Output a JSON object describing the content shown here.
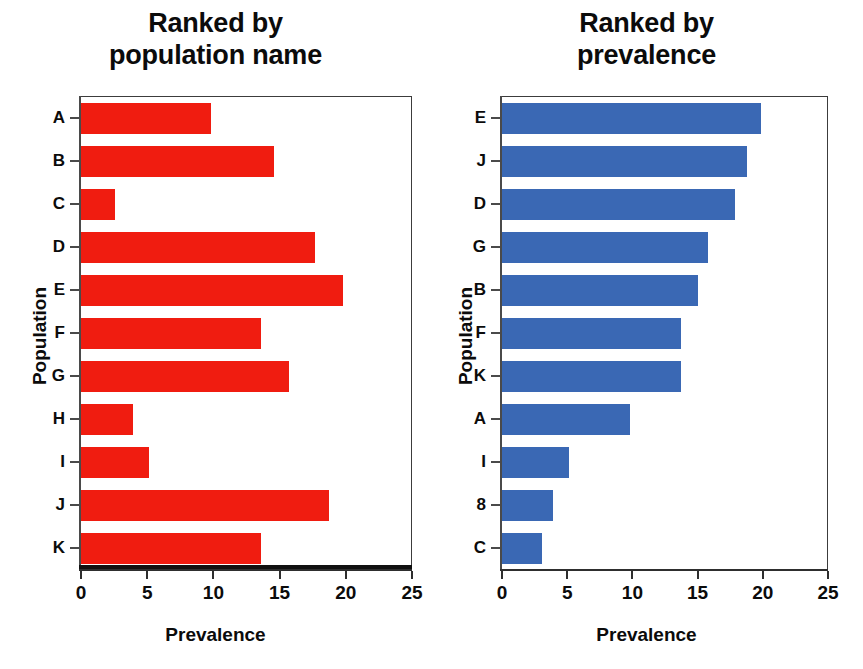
{
  "figure": {
    "axis_color": "#2e2e2e",
    "text_color": "#0b0b0b",
    "background": "#ffffff"
  },
  "panels": [
    {
      "id": "left",
      "title_line1": "Ranked by",
      "title_line2": "population name",
      "xlabel": "Prevalence",
      "ylabel": "Population"
    },
    {
      "id": "right",
      "title_line1": "Ranked by",
      "title_line2": "prevalence",
      "xlabel": "Prevalence",
      "ylabel": "Population"
    }
  ],
  "chart_data": [
    {
      "type": "bar",
      "orientation": "horizontal",
      "title": "Ranked by population name",
      "xlabel": "Prevalence",
      "ylabel": "Population",
      "xlim": [
        0,
        25
      ],
      "xticks": [
        0,
        5,
        10,
        15,
        20,
        25
      ],
      "xtick_labels": [
        "0",
        "5",
        "10",
        "15",
        "20",
        "25"
      ],
      "grid": false,
      "legend": "none",
      "color": "#f01c10",
      "categories": [
        "A",
        "B",
        "C",
        "D",
        "E",
        "F",
        "G",
        "H",
        "I",
        "J",
        "K"
      ],
      "values": [
        9.8,
        14.6,
        2.6,
        17.7,
        19.8,
        13.6,
        15.7,
        3.9,
        5.1,
        18.7,
        13.6
      ]
    },
    {
      "type": "bar",
      "orientation": "horizontal",
      "title": "Ranked by prevalence",
      "xlabel": "Prevalence",
      "ylabel": "Population",
      "xlim": [
        0,
        25
      ],
      "xticks": [
        0,
        5,
        10,
        15,
        20,
        25
      ],
      "xtick_labels": [
        "0",
        "5",
        "10",
        "15",
        "20",
        "25"
      ],
      "grid": false,
      "legend": "none",
      "color": "#3a68b4",
      "categories": [
        "E",
        "J",
        "D",
        "G",
        "B",
        "F",
        "K",
        "A",
        "I",
        "8",
        "C"
      ],
      "values": [
        19.9,
        18.8,
        17.9,
        15.8,
        15.0,
        13.7,
        13.7,
        9.8,
        5.1,
        3.9,
        3.1
      ]
    }
  ]
}
